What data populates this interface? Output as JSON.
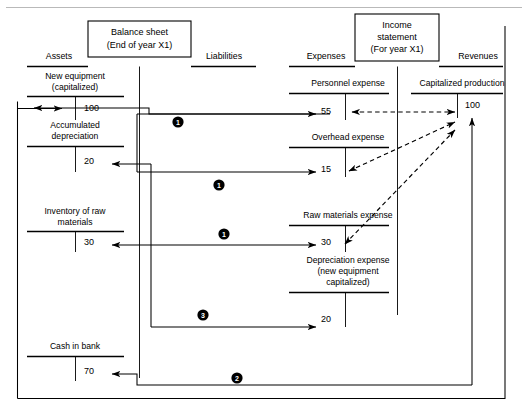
{
  "figure": {
    "type": "accounting-t-account-flow-diagram",
    "top_rule": true
  },
  "statements": {
    "balance_sheet": {
      "box_title_line1": "Balance sheet",
      "box_title_line2": "(End of year X1)",
      "left_header": "Assets",
      "right_header": "Liabilities"
    },
    "income_statement": {
      "box_title_line1": "Income",
      "box_title_line2": "statement",
      "box_title_line3": "(For year X1)",
      "left_header": "Expenses",
      "right_header": "Revenues"
    }
  },
  "accounts": {
    "assets": [
      {
        "name_line1": "New equipment",
        "name_line2": "(capitalized)",
        "amount": "100"
      },
      {
        "name_line1": "Accumulated",
        "name_line2": "depreciation",
        "amount": "20"
      },
      {
        "name_line1": "Inventory of raw",
        "name_line2": "materials",
        "amount": "30"
      },
      {
        "name_line1": "Cash in bank",
        "name_line2": "",
        "amount": "70"
      }
    ],
    "expenses": [
      {
        "name_line1": "Personnel expense",
        "name_line2": "",
        "name_line3": "",
        "amount": "55"
      },
      {
        "name_line1": "Overhead expense",
        "name_line2": "",
        "name_line3": "",
        "amount": "15"
      },
      {
        "name_line1": "Raw materials expense",
        "name_line2": "",
        "name_line3": "",
        "amount": "30"
      },
      {
        "name_line1": "Depreciation expense",
        "name_line2": "(new equipment",
        "name_line3": "capitalized)",
        "amount": "20"
      }
    ],
    "revenues": [
      {
        "name_line1": "Capitalized production",
        "name_line2": "",
        "amount": "100"
      }
    ]
  },
  "step_markers": [
    {
      "label": "1",
      "x": 178,
      "y": 122
    },
    {
      "label": "1",
      "x": 219,
      "y": 185
    },
    {
      "label": "1",
      "x": 224,
      "y": 234
    },
    {
      "label": "3",
      "x": 203,
      "y": 315
    },
    {
      "label": "2",
      "x": 237,
      "y": 378
    }
  ],
  "colors": {
    "ink": "#000000",
    "rule_gray": "#b9b9b9",
    "page_bg": "#ffffff"
  }
}
